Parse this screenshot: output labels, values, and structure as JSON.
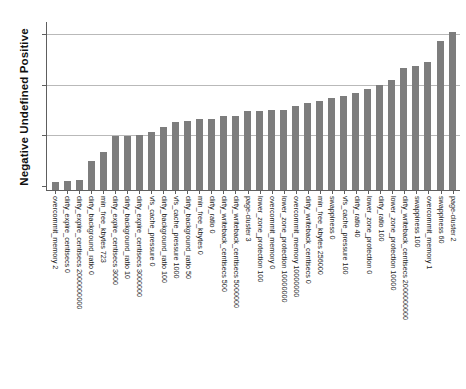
{
  "chart_data": {
    "type": "bar",
    "title": "",
    "subtitle": "",
    "xlabel": "",
    "ylabel": "Negative Undefined Positive",
    "legend": [],
    "grid": true,
    "grid_axis": "y",
    "y_tick_labels": [],
    "y_gridline_count": 3,
    "ylim": [
      0,
      1.0
    ],
    "bar_color": "#7d7d7d",
    "axis_color": "#5e5e5e",
    "grid_color": "#b9b9b9",
    "categories": [
      "overcommit_memory 2",
      "dirty_expire_centisecs 0",
      "dirty_expire_centisecs 2000000000",
      "dirty_background_ratio 0",
      "min_free_kbytes 723",
      "dirty_expire_centisecs 3000",
      "dirty_background_ratio 10",
      "dirty_expire_centisecs 3000000",
      "vfs_cache_pressure 0",
      "dirty_background_ratio 100",
      "vfs_cache_pressure 1000",
      "dirty_background_ratio 50",
      "min_free_kbytes 0",
      "dirty_ratio 0",
      "dirty_writeback_centisecs 500",
      "dirty_writeback_centisecs 5000000",
      "page-cluster 3",
      "lower_zone_protection 100",
      "overcommit_memory 0",
      "lower_zone_protection 10000000",
      "overcommit_memory 10000000",
      "dirty_writeback_centisecs 0",
      "min_free_kbytes 256000",
      "swappiness 0",
      "vfs_cache_pressure 100",
      "dirty_ratio 40",
      "lower_zone_protection 0",
      "dirty_ratio 100",
      "lower_zone_protection 10000",
      "dirty_writeback_centisecs 2000000000",
      "swappiness 100",
      "overcommit_memory 1",
      "swappiness 60",
      "page-cluster 2"
    ],
    "values": [
      0.048,
      0.054,
      0.06,
      0.172,
      0.226,
      0.324,
      0.324,
      0.33,
      0.345,
      0.375,
      0.405,
      0.411,
      0.423,
      0.423,
      0.44,
      0.44,
      0.47,
      0.47,
      0.476,
      0.476,
      0.5,
      0.518,
      0.53,
      0.548,
      0.56,
      0.577,
      0.601,
      0.625,
      0.655,
      0.726,
      0.738,
      0.762,
      0.887,
      0.94
    ]
  }
}
